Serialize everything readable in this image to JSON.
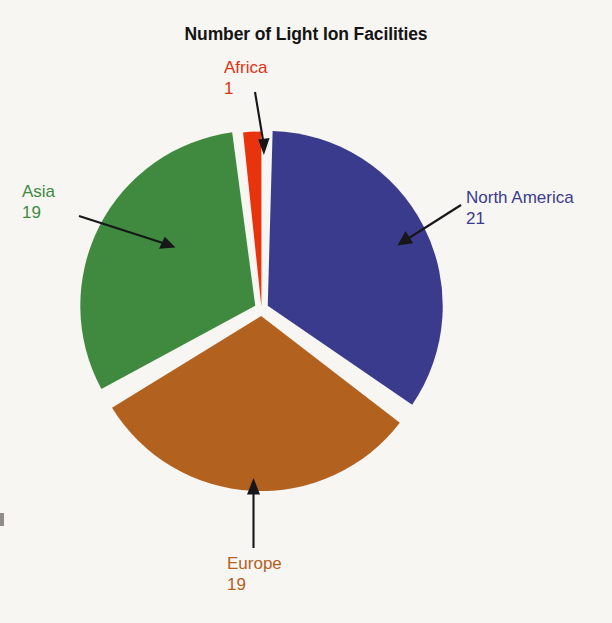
{
  "chart_data": {
    "type": "pie",
    "title": "Number of Light Ion Facilities",
    "categories": [
      "North America",
      "Europe",
      "Asia",
      "Africa"
    ],
    "values": [
      21,
      19,
      19,
      1
    ],
    "total": 60,
    "labels_show_value": true,
    "legend": "none",
    "exploded": true,
    "colors": {
      "north_america": "#3b3b8e",
      "europe": "#b3611f",
      "asia": "#3f8a3f",
      "africa": "#e8330c",
      "background": "#f8f6f3",
      "separator": "#f8f6f3",
      "title_text": "#141414",
      "arrow": "#17171a"
    },
    "slices": [
      {
        "name": "North America",
        "value": 21,
        "color": "#3b3b8e",
        "start_angle_deg": 6,
        "end_angle_deg": 132,
        "label_color": "#3b3b8e"
      },
      {
        "name": "Europe",
        "value": 19,
        "color": "#b3611f",
        "start_angle_deg": 132,
        "end_angle_deg": 246,
        "label_color": "#b3611f"
      },
      {
        "name": "Asia",
        "value": 19,
        "color": "#3f8a3f",
        "start_angle_deg": 246,
        "end_angle_deg": 360,
        "label_color": "#3f8a3f"
      },
      {
        "name": "Africa",
        "value": 1,
        "color": "#e8330c",
        "start_angle_deg": 0,
        "end_angle_deg": 6,
        "label_color": "#e0330f"
      }
    ]
  },
  "chart": {
    "title": "Number of Light Ion Facilities",
    "labels": {
      "africa": {
        "name": "Africa",
        "value": "1"
      },
      "asia": {
        "name": "Asia",
        "value": "19"
      },
      "north_america": {
        "name": "North America",
        "value": "21"
      },
      "europe": {
        "name": "Europe",
        "value": "19"
      }
    }
  }
}
